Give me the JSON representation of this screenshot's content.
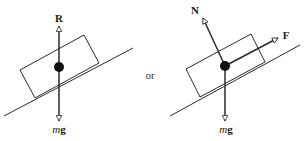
{
  "diagram": {
    "separator_text": "or",
    "colors": {
      "line": "#2a2a2a",
      "text": "#1a1a1a",
      "background": "#ffffff"
    },
    "left": {
      "title": "Forces on block on incline (reaction and weight)",
      "forces": [
        {
          "label": "R",
          "direction": "up",
          "kind": "normal-reaction"
        },
        {
          "label_m": "m",
          "label_g": "g",
          "direction": "down",
          "kind": "weight"
        }
      ]
    },
    "right": {
      "title": "Forces on block on incline (normal, friction, weight)",
      "forces": [
        {
          "label": "N",
          "direction": "perpendicular-to-incline",
          "kind": "normal"
        },
        {
          "label": "F",
          "direction": "up-incline",
          "kind": "friction"
        },
        {
          "label_m": "m",
          "label_g": "g",
          "direction": "down",
          "kind": "weight"
        }
      ]
    }
  }
}
